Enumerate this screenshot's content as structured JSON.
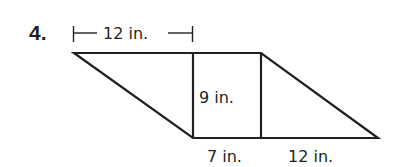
{
  "problem": {
    "number": "4."
  },
  "figure": {
    "type": "trapezoid composed of two triangles and a rectangle",
    "stroke_color": "#231f20",
    "labels": {
      "top_dimension": "12 in.",
      "height": "9 in.",
      "bottom_rect_width": "7 in.",
      "bottom_triangle_base": "12 in."
    }
  }
}
